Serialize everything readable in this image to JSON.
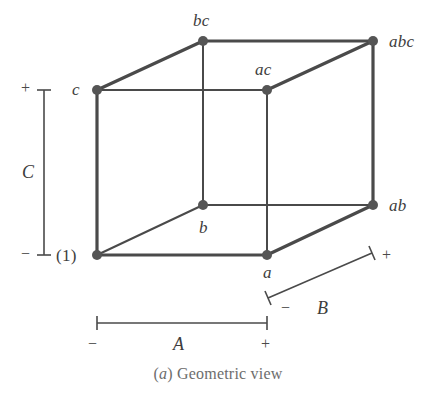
{
  "figure": {
    "caption_prefix": "(",
    "caption_letter": "a",
    "caption_suffix": ") Geometric view",
    "caption_full": "(a) Geometric view",
    "line_color": "#4a4a4a",
    "vertex_color": "#555555",
    "text_color": "#3d3d3d",
    "caption_color": "#6d6d6d",
    "background": "#ffffff"
  },
  "vertices": [
    {
      "id": "one",
      "label": "(1)",
      "x": 97,
      "y": 255,
      "label_x": 56,
      "label_y": 247,
      "italic": false
    },
    {
      "id": "a",
      "label": "a",
      "x": 267,
      "y": 255,
      "label_x": 263,
      "label_y": 264,
      "italic": true
    },
    {
      "id": "b",
      "label": "b",
      "x": 203,
      "y": 205,
      "label_x": 199,
      "label_y": 219,
      "italic": true
    },
    {
      "id": "ab",
      "label": "ab",
      "x": 373,
      "y": 205,
      "label_x": 389,
      "label_y": 197,
      "italic": true
    },
    {
      "id": "c",
      "label": "c",
      "x": 97,
      "y": 90,
      "label_x": 72,
      "label_y": 81,
      "italic": true
    },
    {
      "id": "ac",
      "label": "ac",
      "x": 267,
      "y": 90,
      "label_x": 255,
      "label_y": 61,
      "italic": true
    },
    {
      "id": "bc",
      "label": "bc",
      "x": 203,
      "y": 41,
      "label_x": 193,
      "label_y": 12,
      "italic": true
    },
    {
      "id": "abc",
      "label": "abc",
      "x": 373,
      "y": 41,
      "label_x": 389,
      "label_y": 33,
      "italic": true
    }
  ],
  "axes": [
    {
      "id": "C",
      "name": "C",
      "name_x": 22,
      "name_y": 163,
      "plus": "+",
      "plus_x": 21,
      "plus_y": 80,
      "minus": "−",
      "minus_x": 21,
      "minus_y": 246,
      "line": {
        "x1": 44,
        "y1": 90,
        "x2": 44,
        "y2": 255
      },
      "tick1": {
        "x1": 37,
        "y1": 90,
        "x2": 51,
        "y2": 90
      },
      "tick2": {
        "x1": 37,
        "y1": 255,
        "x2": 51,
        "y2": 255
      }
    },
    {
      "id": "A",
      "name": "A",
      "name_x": 173,
      "name_y": 335,
      "plus": "+",
      "plus_x": 261,
      "plus_y": 336,
      "minus": "−",
      "minus_x": 88,
      "minus_y": 336,
      "line": {
        "x1": 97,
        "y1": 323,
        "x2": 267,
        "y2": 323
      },
      "tick1": {
        "x1": 97,
        "y1": 316,
        "x2": 97,
        "y2": 330
      },
      "tick2": {
        "x1": 267,
        "y1": 316,
        "x2": 267,
        "y2": 330
      }
    },
    {
      "id": "B",
      "name": "B",
      "name_x": 317,
      "name_y": 299,
      "plus": "+",
      "plus_x": 382,
      "plus_y": 247,
      "minus": "−",
      "minus_x": 281,
      "minus_y": 300,
      "line": {
        "x1": 268,
        "y1": 298,
        "x2": 372,
        "y2": 253
      },
      "tick1": {
        "x1": 265,
        "y1": 291,
        "x2": 271,
        "y2": 305
      },
      "tick2": {
        "x1": 369,
        "y1": 246,
        "x2": 375,
        "y2": 260
      }
    }
  ],
  "edges": [
    {
      "id": "front-bottom",
      "from": "one",
      "to": "a",
      "weight": "thick"
    },
    {
      "id": "front-left",
      "from": "one",
      "to": "c",
      "weight": "thick"
    },
    {
      "id": "front-top",
      "from": "c",
      "to": "ac",
      "weight": "thin"
    },
    {
      "id": "front-right",
      "from": "a",
      "to": "ac",
      "weight": "thin"
    },
    {
      "id": "back-bottom",
      "from": "b",
      "to": "ab",
      "weight": "thin"
    },
    {
      "id": "back-left",
      "from": "b",
      "to": "bc",
      "weight": "thin"
    },
    {
      "id": "back-top",
      "from": "bc",
      "to": "abc",
      "weight": "thick"
    },
    {
      "id": "back-right",
      "from": "ab",
      "to": "abc",
      "weight": "thick"
    },
    {
      "id": "depth-bottom-left",
      "from": "one",
      "to": "b",
      "weight": "thin"
    },
    {
      "id": "depth-bottom-right",
      "from": "a",
      "to": "ab",
      "weight": "thick"
    },
    {
      "id": "depth-top-left",
      "from": "c",
      "to": "bc",
      "weight": "thick"
    },
    {
      "id": "depth-top-right",
      "from": "ac",
      "to": "abc",
      "weight": "thick"
    }
  ]
}
